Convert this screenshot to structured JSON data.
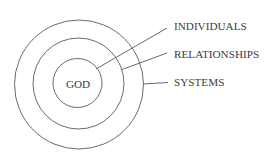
{
  "diagram": {
    "type": "concentric-circles",
    "center_label": "GOD",
    "rings": [
      {
        "name": "inner",
        "label": "INDIVIDUALS"
      },
      {
        "name": "middle",
        "label": "RELATIONSHIPS"
      },
      {
        "name": "outer",
        "label": "SYSTEMS"
      }
    ],
    "colors": {
      "stroke": "#5a5a5a",
      "text": "#3c3c3c",
      "background": "#ffffff"
    }
  }
}
